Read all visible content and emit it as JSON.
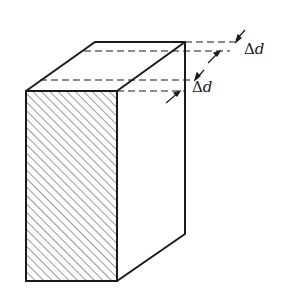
{
  "figure": {
    "colors": {
      "line": "#1a1a1a",
      "hatch": "#333333",
      "background": "#ffffff"
    }
  },
  "labels": {
    "delta_d_upper": {
      "delta": "Δ",
      "var": "d"
    },
    "delta_d_lower": {
      "delta": "Δ",
      "var": "d"
    }
  }
}
